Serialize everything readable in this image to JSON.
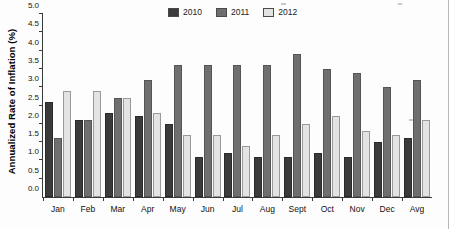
{
  "figure": {
    "title_remnant": "",
    "background_color": "#fdfdfd"
  },
  "legend": {
    "position": "top-center",
    "items": [
      {
        "label": "2010",
        "color": "#3b3b3b"
      },
      {
        "label": "2011",
        "color": "#6f6f6f"
      },
      {
        "label": "2012",
        "color": "#e3e3e3"
      }
    ]
  },
  "axes": {
    "ylabel": "Annualized Rate of Inflation (%)",
    "xlabel": "",
    "yticks": [
      "0.0",
      "0.5",
      "1.0",
      "1.5",
      "2.0",
      "2.5",
      "3.0",
      "3.5",
      "4.0",
      "4.5",
      "5.0"
    ]
  },
  "chart_data": {
    "type": "bar",
    "title": "",
    "xlabel": "",
    "ylabel": "Annualized Rate of Inflation (%)",
    "ylim": [
      0.0,
      5.0
    ],
    "ytick_step": 0.5,
    "grid": false,
    "legend_position": "top-center",
    "categories": [
      "Jan",
      "Feb",
      "Mar",
      "Apr",
      "May",
      "Jun",
      "Jul",
      "Aug",
      "Sept",
      "Oct",
      "Nov",
      "Dec",
      "Avg"
    ],
    "series": [
      {
        "name": "2010",
        "color": "#3b3b3b",
        "values": [
          2.6,
          2.1,
          2.3,
          2.2,
          2.0,
          1.1,
          1.2,
          1.1,
          1.1,
          1.2,
          1.1,
          1.5,
          1.6
        ]
      },
      {
        "name": "2011",
        "color": "#6f6f6f",
        "values": [
          1.6,
          2.1,
          2.7,
          3.2,
          3.6,
          3.6,
          3.6,
          3.6,
          3.9,
          3.5,
          3.4,
          3.0,
          3.2
        ]
      },
      {
        "name": "2012",
        "color": "#e3e3e3",
        "values": [
          2.9,
          2.9,
          2.7,
          2.3,
          1.7,
          1.7,
          1.4,
          1.7,
          2.0,
          2.2,
          1.8,
          1.7,
          2.1
        ]
      }
    ]
  }
}
